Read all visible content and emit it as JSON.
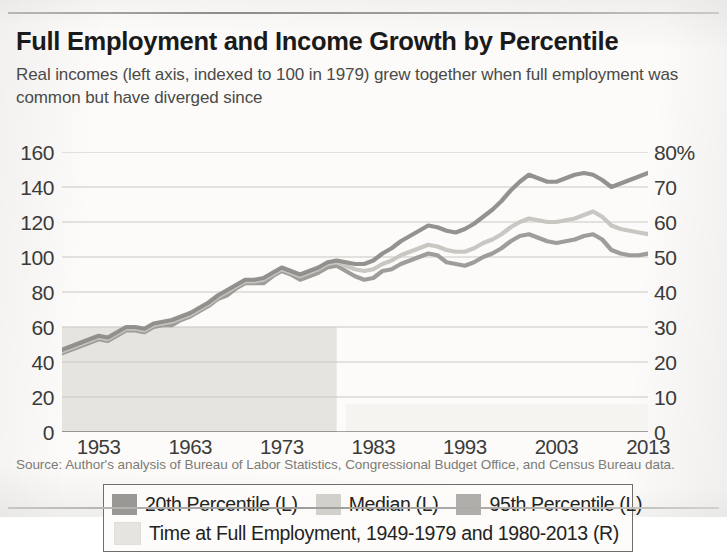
{
  "header": {
    "title": "Full Employment and Income Growth by Percentile",
    "subtitle": "Real incomes (left axis, indexed to 100 in 1979) grew together when full employment was common but have diverged since"
  },
  "source_note": "Source: Author's analysis of Bureau of Labor Statistics, Congressional Budget Office, and Census Bureau data.",
  "legend": {
    "items": [
      {
        "label": "20th Percentile (L)",
        "color": "#9a9894"
      },
      {
        "label": "Median (L)",
        "color": "#d2d0cb"
      },
      {
        "label": "95th Percentile (L)",
        "color": "#b0aeaa"
      },
      {
        "label": "Time at Full Employment, 1949-1979 and 1980-2013 (R)",
        "color": "#e6e4df"
      }
    ]
  },
  "chart_data": {
    "type": "line",
    "title": "Full Employment and Income Growth by Percentile",
    "subtitle": "Real incomes (left axis, indexed to 100 in 1979) grew together when full employment was common but have diverged since",
    "xlabel": "",
    "ylabel": "Index (1979 = 100)",
    "ylabel_right": "Share of time at full employment",
    "grid": true,
    "legend_position": "inside-bottom-left",
    "xlim": [
      1949,
      2013
    ],
    "ylim": [
      0,
      160
    ],
    "ylim_right": [
      0,
      80
    ],
    "yticks": [
      0,
      20,
      40,
      60,
      80,
      100,
      120,
      140,
      160
    ],
    "yticks_right": [
      "0",
      "10",
      "20",
      "30",
      "40",
      "50",
      "60",
      "70",
      "80%"
    ],
    "xticks": [
      1953,
      1963,
      1973,
      1983,
      1993,
      2003,
      2013
    ],
    "x": [
      1949,
      1950,
      1951,
      1952,
      1953,
      1954,
      1955,
      1956,
      1957,
      1958,
      1959,
      1960,
      1961,
      1962,
      1963,
      1964,
      1965,
      1966,
      1967,
      1968,
      1969,
      1970,
      1971,
      1972,
      1973,
      1974,
      1975,
      1976,
      1977,
      1978,
      1979,
      1980,
      1981,
      1982,
      1983,
      1984,
      1985,
      1986,
      1987,
      1988,
      1989,
      1990,
      1991,
      1992,
      1993,
      1994,
      1995,
      1996,
      1997,
      1998,
      1999,
      2000,
      2001,
      2002,
      2003,
      2004,
      2005,
      2006,
      2007,
      2008,
      2009,
      2010,
      2011,
      2012,
      2013
    ],
    "series": [
      {
        "name": "20th Percentile (L)",
        "axis": "left",
        "color": "#9a9894",
        "values": [
          45,
          47,
          49,
          51,
          53,
          52,
          55,
          58,
          58,
          57,
          60,
          61,
          61,
          64,
          66,
          69,
          72,
          76,
          78,
          82,
          85,
          85,
          85,
          89,
          92,
          90,
          87,
          89,
          91,
          94,
          95,
          92,
          89,
          87,
          88,
          92,
          93,
          96,
          98,
          100,
          102,
          101,
          97,
          96,
          95,
          97,
          100,
          102,
          105,
          109,
          112,
          113,
          111,
          109,
          108,
          109,
          110,
          112,
          113,
          110,
          104,
          102,
          101,
          101,
          102
        ]
      },
      {
        "name": "Median (L)",
        "axis": "left",
        "color": "#c6c4bf",
        "values": [
          46,
          48,
          50,
          52,
          54,
          53,
          56,
          59,
          59,
          58,
          61,
          62,
          63,
          65,
          67,
          70,
          73,
          77,
          80,
          83,
          86,
          86,
          87,
          90,
          93,
          91,
          89,
          91,
          93,
          96,
          97,
          95,
          93,
          92,
          93,
          96,
          98,
          101,
          103,
          105,
          107,
          106,
          104,
          103,
          103,
          105,
          108,
          110,
          113,
          117,
          120,
          122,
          121,
          120,
          120,
          121,
          122,
          124,
          126,
          123,
          118,
          116,
          115,
          114,
          113
        ]
      },
      {
        "name": "95th Percentile (L)",
        "axis": "left",
        "color": "#8e8c88",
        "values": [
          47,
          49,
          51,
          53,
          55,
          54,
          57,
          60,
          60,
          59,
          62,
          63,
          64,
          66,
          68,
          71,
          74,
          78,
          81,
          84,
          87,
          87,
          88,
          91,
          94,
          92,
          90,
          92,
          94,
          97,
          98,
          97,
          96,
          96,
          98,
          102,
          105,
          109,
          112,
          115,
          118,
          117,
          115,
          114,
          116,
          119,
          123,
          127,
          132,
          138,
          143,
          147,
          145,
          143,
          143,
          145,
          147,
          148,
          147,
          144,
          140,
          142,
          144,
          146,
          148
        ]
      }
    ],
    "shaded_bands": [
      {
        "name": "Time at Full Employment, 1949-1979 (R)",
        "axis": "right",
        "color": "#e6e4df",
        "x_start": 1949,
        "x_end": 1979,
        "value": 30
      },
      {
        "name": "Time at Full Employment, 1980-2013 (R)",
        "axis": "right",
        "color": "#f5f4f1",
        "x_start": 1980,
        "x_end": 2013,
        "value": 8
      }
    ]
  }
}
